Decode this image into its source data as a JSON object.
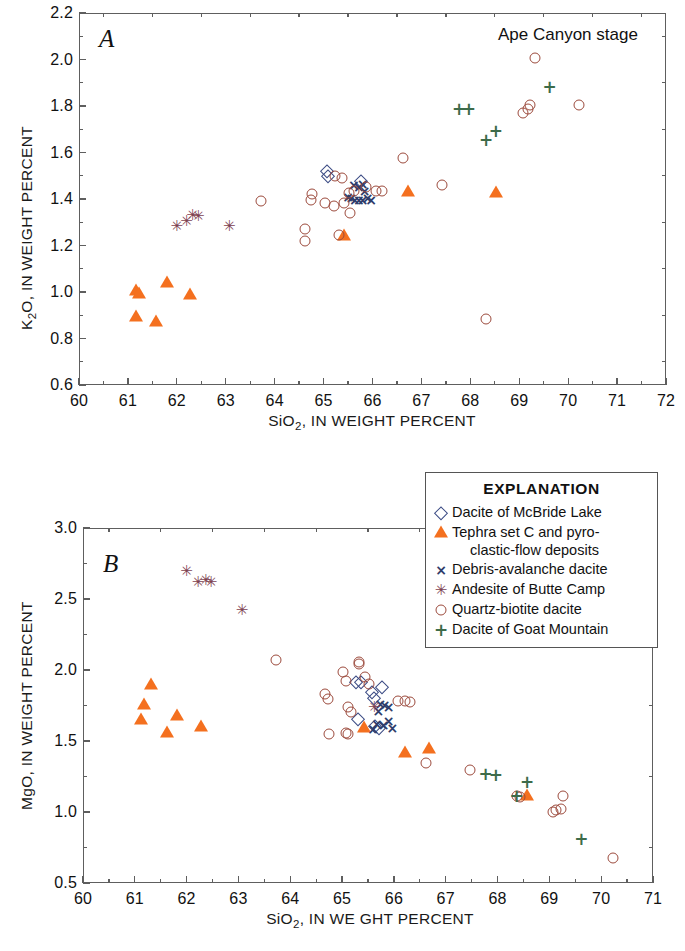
{
  "figure": {
    "stage_title": "Ape Canyon stage",
    "panel_a_letter": "A",
    "panel_b_letter": "B"
  },
  "legend": {
    "title": "EXPLANATION",
    "entries": [
      {
        "symbol": "diamond",
        "label": "Dacite of McBride Lake",
        "color": "#3b4b84"
      },
      {
        "symbol": "triangle",
        "label": "Tephra set C and pyro-",
        "label_cont": "clastic-flow deposits",
        "color": "#F4701F"
      },
      {
        "symbol": "x",
        "label": "Debris-avalanche dacite",
        "color": "#2f3d6b"
      },
      {
        "symbol": "star",
        "label": "Andesite of Butte Camp",
        "color": "#7d4150"
      },
      {
        "symbol": "circle",
        "label": "Quartz-biotite dacite",
        "color": "#9c4a3c"
      },
      {
        "symbol": "plus",
        "label": "Dacite of Goat Mountain",
        "color": "#3d6b4a"
      }
    ]
  },
  "chart_data": [
    {
      "id": "panel-a",
      "type": "scatter",
      "title": "Ape Canyon stage",
      "panel_label": "A",
      "xlabel": "SiO2, IN WEIGHT PERCENT",
      "ylabel": "K2O, IN WEIGHT PERCENT",
      "xlim": [
        60,
        72
      ],
      "ylim": [
        0.6,
        2.2
      ],
      "xticks": [
        60,
        61,
        62,
        63,
        64,
        65,
        66,
        67,
        68,
        69,
        70,
        71,
        72
      ],
      "xtick_labels": [
        "60",
        "61",
        "62",
        "63",
        "64",
        "65",
        "66",
        "67",
        "68",
        "69",
        "70",
        "71",
        "72"
      ],
      "yticks": [
        0.6,
        0.8,
        1.0,
        1.2,
        1.4,
        1.6,
        1.8,
        2.0,
        2.2
      ],
      "ytick_labels": [
        "0.6",
        "0.8",
        "1.0",
        "1.2",
        "1.4",
        "1.6",
        "1.8",
        "2.0",
        "2.2"
      ],
      "x_minor_step": 0.5,
      "y_minor_step": 0.1,
      "grid": false,
      "legend_position": "external-right",
      "series": [
        {
          "name": "Dacite of McBride Lake",
          "symbol": "diamond",
          "color": "#3b4b84",
          "points": [
            [
              65.05,
              1.525
            ],
            [
              65.08,
              1.505
            ],
            [
              65.75,
              1.48
            ]
          ]
        },
        {
          "name": "Tephra set C and pyroclastic-flow deposits",
          "symbol": "triangle",
          "color": "#F4701F",
          "points": [
            [
              61.15,
              1.01
            ],
            [
              61.2,
              0.995
            ],
            [
              61.15,
              0.895
            ],
            [
              61.55,
              0.875
            ],
            [
              61.78,
              1.045
            ],
            [
              62.25,
              0.99
            ],
            [
              65.4,
              1.245
            ],
            [
              66.7,
              1.435
            ],
            [
              68.5,
              1.43
            ]
          ]
        },
        {
          "name": "Debris-avalanche dacite",
          "symbol": "x",
          "color": "#2f3d6b",
          "points": [
            [
              65.6,
              1.465
            ],
            [
              65.7,
              1.455
            ],
            [
              65.78,
              1.47
            ],
            [
              65.82,
              1.44
            ],
            [
              65.55,
              1.41
            ],
            [
              65.62,
              1.4
            ],
            [
              65.7,
              1.4
            ],
            [
              65.78,
              1.4
            ],
            [
              65.88,
              1.41
            ],
            [
              65.95,
              1.4
            ],
            [
              65.48,
              1.415
            ]
          ]
        },
        {
          "name": "Andesite of Butte Camp",
          "symbol": "star",
          "color": "#7d4150",
          "points": [
            [
              61.98,
              1.29
            ],
            [
              62.18,
              1.31
            ],
            [
              62.3,
              1.335
            ],
            [
              62.42,
              1.33
            ],
            [
              63.05,
              1.29
            ]
          ]
        },
        {
          "name": "Quartz-biotite dacite",
          "symbol": "circle",
          "color": "#9c4a3c",
          "points": [
            [
              63.7,
              1.395
            ],
            [
              64.6,
              1.275
            ],
            [
              64.6,
              1.225
            ],
            [
              64.72,
              1.4
            ],
            [
              64.75,
              1.425
            ],
            [
              65.0,
              1.385
            ],
            [
              65.2,
              1.375
            ],
            [
              65.22,
              1.505
            ],
            [
              65.3,
              1.25
            ],
            [
              65.35,
              1.495
            ],
            [
              65.4,
              1.385
            ],
            [
              65.5,
              1.43
            ],
            [
              65.52,
              1.345
            ],
            [
              65.6,
              1.44
            ],
            [
              65.85,
              1.455
            ],
            [
              66.05,
              1.44
            ],
            [
              66.18,
              1.44
            ],
            [
              66.6,
              1.58
            ],
            [
              67.4,
              1.465
            ],
            [
              68.3,
              0.89
            ],
            [
              69.05,
              1.775
            ],
            [
              69.15,
              1.79
            ],
            [
              69.2,
              1.81
            ],
            [
              69.3,
              2.01
            ],
            [
              70.2,
              1.81
            ]
          ]
        },
        {
          "name": "Dacite of Goat Mountain",
          "symbol": "plus",
          "color": "#3d6b4a",
          "points": [
            [
              67.75,
              1.79
            ],
            [
              67.95,
              1.79
            ],
            [
              68.3,
              1.66
            ],
            [
              68.5,
              1.695
            ],
            [
              69.6,
              1.885
            ]
          ]
        }
      ]
    },
    {
      "id": "panel-b",
      "type": "scatter",
      "panel_label": "B",
      "xlabel": "SiO2, IN WE GHT PERCENT",
      "ylabel": "MgO, IN WEIGHT PERCENT",
      "xlim": [
        60,
        71
      ],
      "ylim": [
        0.5,
        3.0
      ],
      "xticks": [
        60,
        61,
        62,
        63,
        64,
        65,
        66,
        67,
        68,
        69,
        70,
        71
      ],
      "xtick_labels": [
        "60",
        "61",
        "62",
        "63",
        "64",
        "65",
        "66",
        "67",
        "68",
        "69",
        "70",
        "71"
      ],
      "yticks": [
        0.5,
        1.0,
        1.5,
        2.0,
        2.5,
        3.0
      ],
      "ytick_labels": [
        "0.5",
        "1.0",
        "1.5",
        "2.0",
        "2.5",
        "3.0"
      ],
      "x_minor_step": 0.5,
      "y_minor_step": 0.25,
      "grid": false,
      "legend_position": "top-right",
      "series": [
        {
          "name": "Dacite of McBride Lake",
          "symbol": "diamond",
          "color": "#3b4b84",
          "points": [
            [
              65.25,
              1.92
            ],
            [
              65.35,
              1.92
            ],
            [
              65.55,
              1.85
            ],
            [
              65.6,
              1.81
            ],
            [
              65.75,
              1.89
            ],
            [
              65.28,
              1.66
            ],
            [
              65.62,
              1.61
            ],
            [
              65.7,
              1.6
            ]
          ]
        },
        {
          "name": "Tephra set C and pyroclastic-flow deposits",
          "symbol": "triangle",
          "color": "#F4701F",
          "points": [
            [
              61.3,
              1.9
            ],
            [
              61.15,
              1.76
            ],
            [
              61.1,
              1.655
            ],
            [
              61.6,
              1.565
            ],
            [
              61.8,
              1.68
            ],
            [
              62.25,
              1.605
            ],
            [
              65.4,
              1.6
            ],
            [
              66.2,
              1.425
            ],
            [
              66.65,
              1.45
            ],
            [
              68.55,
              1.12
            ]
          ]
        },
        {
          "name": "Debris-avalanche dacite",
          "symbol": "x",
          "color": "#2f3d6b",
          "points": [
            [
              65.72,
              1.77
            ],
            [
              65.8,
              1.76
            ],
            [
              65.88,
              1.75
            ],
            [
              65.65,
              1.63
            ],
            [
              65.78,
              1.62
            ],
            [
              65.88,
              1.65
            ],
            [
              65.95,
              1.6
            ],
            [
              65.58,
              1.59
            ],
            [
              65.68,
              1.72
            ]
          ]
        },
        {
          "name": "Andesite of Butte Camp",
          "symbol": "star",
          "color": "#7d4150",
          "points": [
            [
              61.98,
              2.705
            ],
            [
              62.2,
              2.625
            ],
            [
              62.35,
              2.64
            ],
            [
              62.45,
              2.63
            ],
            [
              63.05,
              2.43
            ],
            [
              65.6,
              1.75
            ]
          ]
        },
        {
          "name": "Quartz-biotite dacite",
          "symbol": "circle",
          "color": "#9c4a3c",
          "points": [
            [
              63.7,
              2.08
            ],
            [
              64.65,
              1.84
            ],
            [
              64.7,
              1.8
            ],
            [
              64.72,
              1.555
            ],
            [
              65.0,
              1.995
            ],
            [
              65.05,
              1.93
            ],
            [
              65.05,
              1.56
            ],
            [
              65.1,
              1.555
            ],
            [
              65.1,
              1.75
            ],
            [
              65.3,
              2.06
            ],
            [
              65.3,
              2.05
            ],
            [
              65.42,
              1.96
            ],
            [
              65.5,
              1.91
            ],
            [
              65.15,
              1.71
            ],
            [
              66.05,
              1.79
            ],
            [
              66.2,
              1.79
            ],
            [
              66.3,
              1.78
            ],
            [
              66.6,
              1.355
            ],
            [
              67.45,
              1.305
            ],
            [
              68.35,
              1.12
            ],
            [
              68.42,
              1.11
            ],
            [
              69.05,
              1.01
            ],
            [
              69.1,
              1.02
            ],
            [
              69.2,
              1.03
            ],
            [
              69.25,
              1.12
            ],
            [
              70.2,
              0.68
            ]
          ]
        },
        {
          "name": "Dacite of Goat Mountain",
          "symbol": "plus",
          "color": "#3d6b4a",
          "points": [
            [
              67.75,
              1.275
            ],
            [
              67.95,
              1.27
            ],
            [
              68.35,
              1.12
            ],
            [
              68.55,
              1.215
            ],
            [
              69.6,
              0.815
            ]
          ]
        }
      ]
    }
  ]
}
